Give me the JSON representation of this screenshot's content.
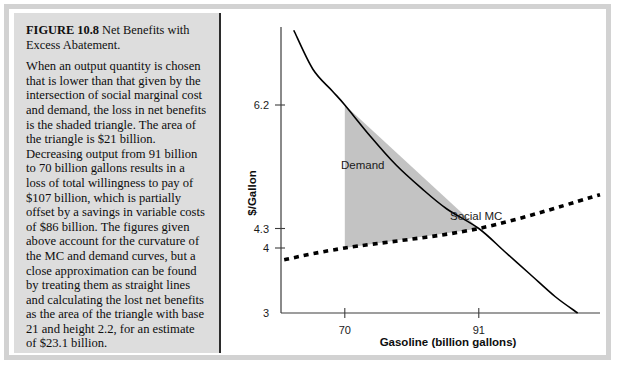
{
  "figure": {
    "number_label": "FIGURE 10.8",
    "title": "Net Benefits with Excess Abatement.",
    "caption": "When an output quantity is chosen that is lower than that given by the intersection of social marginal cost and demand, the loss in net benefits is the shaded triangle. The area of the triangle is $21 billion. Decreasing output from 91 billion to 70 billion gallons results in a loss of total willingness to pay of $107 billion, which is partially offset by a savings in variable costs of $86 billion. The figures given above account for the curvature of the MC and demand curves, but a close approximation can be found by treating them as straight lines and calculating the lost net benefits as the area of the triangle with base 21 and height 2.2, for an estimate of $23.1 billion."
  },
  "colors": {
    "shaded_triangle": "#c3c3c3",
    "curve": "#000000",
    "axis": "#3c3c3c",
    "panel_background": "#dddddd",
    "frame": "#d2d2d2"
  },
  "chart_data": {
    "type": "line",
    "title": "",
    "xlabel": "Gasoline (billion gallons)",
    "ylabel": "$/Gallon",
    "x_ticks": [
      "70",
      "91"
    ],
    "x_tick_values": [
      70,
      91
    ],
    "y_ticks": [
      "6.2",
      "4.3",
      "4",
      "3"
    ],
    "y_tick_values": [
      6.2,
      4.3,
      4,
      3
    ],
    "xlim": [
      60,
      110
    ],
    "ylim": [
      3,
      7.4
    ],
    "grid": false,
    "legend": "inline-labels",
    "series": [
      {
        "name": "Demand",
        "style": "solid",
        "label": "Demand",
        "points": [
          {
            "x": 62.0,
            "y": 7.35
          },
          {
            "x": 65.0,
            "y": 6.75
          },
          {
            "x": 68.0,
            "y": 6.42
          },
          {
            "x": 70.0,
            "y": 6.2
          },
          {
            "x": 74.0,
            "y": 5.72
          },
          {
            "x": 78.0,
            "y": 5.28
          },
          {
            "x": 82.0,
            "y": 4.92
          },
          {
            "x": 86.0,
            "y": 4.6
          },
          {
            "x": 91.0,
            "y": 4.3
          },
          {
            "x": 95.0,
            "y": 3.95
          },
          {
            "x": 99.0,
            "y": 3.6
          },
          {
            "x": 103.0,
            "y": 3.25
          },
          {
            "x": 106.5,
            "y": 3.0
          }
        ]
      },
      {
        "name": "Social MC",
        "style": "dotted",
        "label": "Social MC",
        "points": [
          {
            "x": 60.5,
            "y": 3.82
          },
          {
            "x": 70.0,
            "y": 4.0
          },
          {
            "x": 91.0,
            "y": 4.3
          },
          {
            "x": 110.0,
            "y": 4.82
          }
        ]
      }
    ],
    "annotations": [
      {
        "name": "deadweight-loss-triangle",
        "type": "shaded-region",
        "label": "shaded triangle",
        "vertices": [
          {
            "x": 70.0,
            "y": 6.2
          },
          {
            "x": 70.0,
            "y": 4.0
          },
          {
            "x": 91.0,
            "y": 4.3
          }
        ],
        "area_billion_dollars": 21
      }
    ]
  }
}
